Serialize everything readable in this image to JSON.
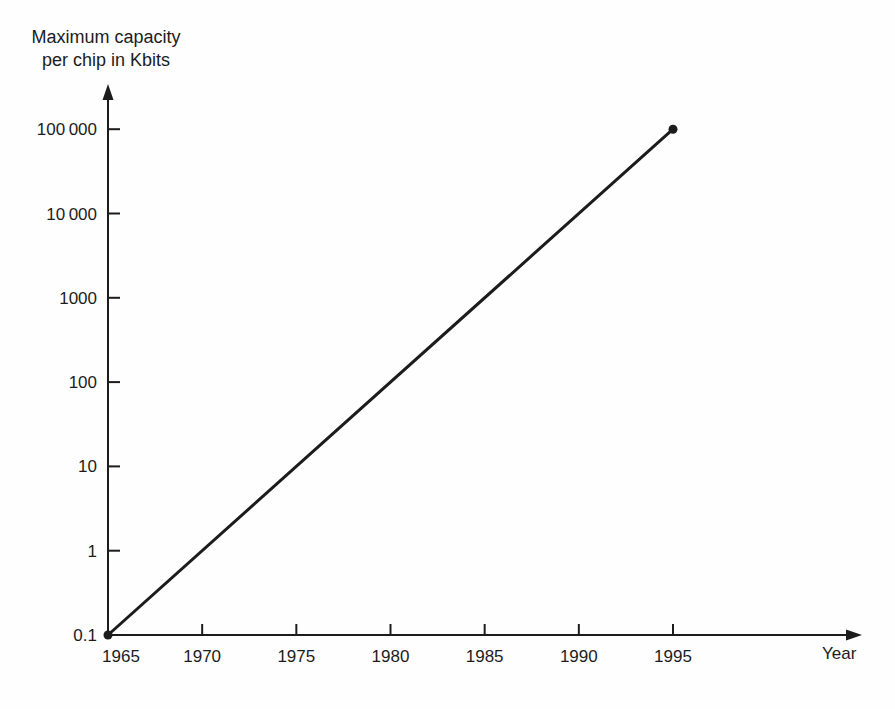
{
  "colors": {
    "ink": "#1c1c1c",
    "background": "#fefefe"
  },
  "chart_data": {
    "type": "line",
    "title_lines": [
      "Maximum capacity",
      "per chip in Kbits"
    ],
    "ylabel": "Maximum capacity per chip in Kbits",
    "xlabel": "Year",
    "y_scale": "log",
    "x_scale": "linear",
    "xlim": [
      1965,
      2005
    ],
    "ylim": [
      0.1,
      100000
    ],
    "grid": false,
    "legend": "none",
    "x_tick_values": [
      1965,
      1970,
      1975,
      1980,
      1985,
      1990,
      1995
    ],
    "x_tick_labels": [
      "1965",
      "1970",
      "1975",
      "1980",
      "1985",
      "1990",
      "1995"
    ],
    "y_tick_values": [
      100000,
      10000,
      1000,
      100,
      10,
      1,
      0.1
    ],
    "y_tick_labels": [
      "100 000",
      "10 000",
      "1000",
      "100",
      "10",
      "1",
      "0.1"
    ],
    "series": [
      {
        "name": "Maximum capacity per chip",
        "marker": "filled-circle",
        "points": [
          {
            "x": 1965,
            "y": 0.1
          },
          {
            "x": 1995,
            "y": 100000
          }
        ]
      }
    ]
  }
}
